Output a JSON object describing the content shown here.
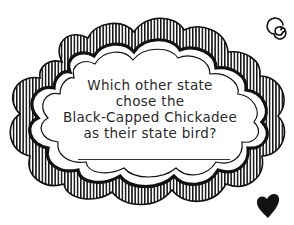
{
  "card": {
    "question_lines": [
      "Which other state",
      "chose the",
      "Black-Capped Chickadee",
      "as their state bird?"
    ],
    "answer_value": ""
  },
  "decorations": {
    "frame": "scalloped-cloud-frame",
    "top_right_icon": "spiral-icon",
    "bottom_right_icon": "heart-icon",
    "ink_color": "#111111",
    "background_color": "#ffffff"
  }
}
